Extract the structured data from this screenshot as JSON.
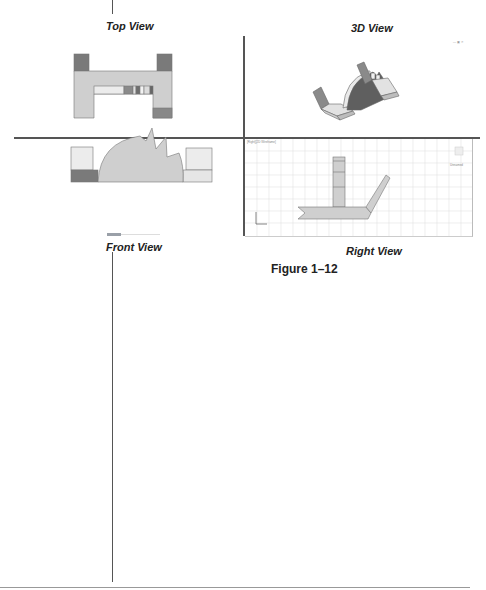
{
  "figure": {
    "number_label": "Figure 1–12",
    "views": [
      {
        "id": "top",
        "label": "Top View"
      },
      {
        "id": "3d",
        "label": "3D View"
      },
      {
        "id": "front",
        "label": "Front View"
      },
      {
        "id": "right",
        "label": "Right View"
      }
    ],
    "viewport_tiny_label": "[Right][2D Wireframe]",
    "viewcube_label": "Unnamed",
    "status_tiny": "MODEL"
  },
  "colors": {
    "part_fill": "#cfcfcf",
    "part_light": "#e6e6e6",
    "part_dark": "#7a7a7a",
    "divider": "#555555",
    "grid": "#e3e3e3",
    "outline": "#666666"
  }
}
